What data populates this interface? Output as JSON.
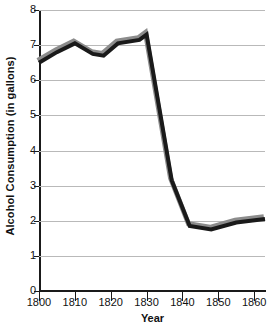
{
  "chart_data": {
    "type": "line",
    "title": "",
    "xlabel": "Year",
    "ylabel": "Alcohol Consumption (in gallons)",
    "xlim": [
      1800,
      1863
    ],
    "ylim": [
      0,
      8
    ],
    "grid": true,
    "legend": false,
    "x_ticks": [
      1800,
      1810,
      1820,
      1830,
      1840,
      1850,
      1860
    ],
    "x_tick_labels": [
      "1800",
      "1810",
      "1820",
      "1830",
      "1840",
      "1850",
      "1860"
    ],
    "y_ticks": [
      0,
      1,
      2,
      3,
      4,
      5,
      6,
      7,
      8
    ],
    "y_tick_labels": [
      "0",
      "1",
      "2",
      "3",
      "4",
      "5",
      "6",
      "7",
      "8"
    ],
    "series": [
      {
        "name": "Alcohol Consumption",
        "color": "#1a1a1a",
        "shadow_color": "#8c8c8c",
        "x": [
          1800,
          1805,
          1810,
          1815,
          1818,
          1822,
          1828,
          1830,
          1837,
          1842,
          1848,
          1855,
          1863
        ],
        "values": [
          6.5,
          6.8,
          7.05,
          6.75,
          6.7,
          7.05,
          7.15,
          7.3,
          3.15,
          1.85,
          1.75,
          1.95,
          2.05
        ]
      }
    ]
  },
  "axis_titles": {
    "y": "Alcohol Consumption (in gallons)",
    "x": "Year"
  },
  "colors": {
    "line": "#1a1a1a",
    "shadow": "#8c8c8c",
    "grid": "#b9b9b9",
    "axis": "#1a1a1a",
    "background": "#ffffff",
    "text": "#111111"
  }
}
